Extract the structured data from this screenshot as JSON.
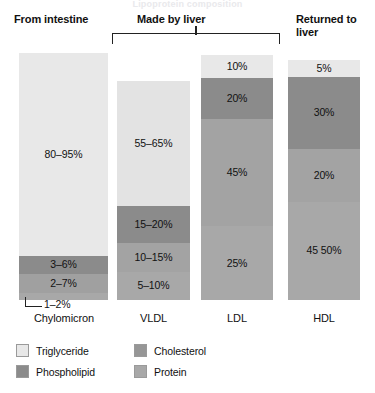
{
  "top_artifact_text": "Lipoprotein composition",
  "headers": {
    "intestine": "From intestine",
    "liver": "Made by liver",
    "returned": "Returned to\nliver"
  },
  "callout": {
    "label": "1–2%"
  },
  "legend": {
    "items": [
      {
        "label": "Triglyceride",
        "color": "#e8e8e8"
      },
      {
        "label": "Cholesterol",
        "color": "#969696"
      },
      {
        "label": "Phospholipid",
        "color": "#8b8b8b"
      },
      {
        "label": "Protein",
        "color": "#a8a8a8"
      }
    ]
  },
  "chart_data": {
    "type": "bar",
    "title": "Lipoprotein composition",
    "subtype": "stacked-bar-100pct",
    "xlabel": "",
    "ylabel": "",
    "ylim": [
      0,
      100
    ],
    "grid": false,
    "legend_position": "bottom-left",
    "categories": [
      "Chylomicron",
      "VLDL",
      "LDL",
      "HDL"
    ],
    "group_headers": [
      {
        "label": "From intestine",
        "categories": [
          "Chylomicron"
        ]
      },
      {
        "label": "Made by liver",
        "categories": [
          "VLDL",
          "LDL"
        ]
      },
      {
        "label": "Returned to liver",
        "categories": [
          "HDL"
        ]
      }
    ],
    "series": [
      {
        "name": "Triglyceride",
        "color": "#e8e8e8",
        "values": [
          87.5,
          60,
          10,
          5
        ]
      },
      {
        "name": "Phospholipid",
        "color": "#8b8b8b",
        "values": [
          4.5,
          17.5,
          20,
          30
        ]
      },
      {
        "name": "Cholesterol",
        "color": "#969696",
        "values": [
          4.5,
          12.5,
          45,
          20
        ]
      },
      {
        "name": "Protein",
        "color": "#a8a8a8",
        "values": [
          1.5,
          7.5,
          25,
          47.5
        ]
      }
    ],
    "bars": [
      {
        "category": "Chylomicron",
        "segments": [
          {
            "component": "Triglyceride",
            "label": "80–95%",
            "low": 80,
            "high": 95,
            "pixel_share": 82.0,
            "color": "#e8e8e8",
            "label_visible": true
          },
          {
            "component": "Phospholipid",
            "label": "3–6%",
            "low": 3,
            "high": 6,
            "pixel_share": 7.5,
            "color": "#8b8b8b",
            "label_visible": true
          },
          {
            "component": "Cholesterol",
            "label": "2–7%",
            "low": 2,
            "high": 7,
            "pixel_share": 7.5,
            "color": "#a0a0a0",
            "label_visible": true
          },
          {
            "component": "Protein",
            "label": "1–2%",
            "low": 1,
            "high": 2,
            "pixel_share": 3.0,
            "color": "#a8a8a8",
            "label_visible": false
          }
        ]
      },
      {
        "category": "VLDL",
        "segments": [
          {
            "component": "Triglyceride",
            "label": "55–65%",
            "low": 55,
            "high": 65,
            "pixel_share": 57.0,
            "color": "#e3e3e3",
            "label_visible": true
          },
          {
            "component": "Phospholipid",
            "label": "15–20%",
            "low": 15,
            "high": 20,
            "pixel_share": 17.0,
            "color": "#8b8b8b",
            "label_visible": true
          },
          {
            "component": "Cholesterol",
            "label": "10–15%",
            "low": 10,
            "high": 15,
            "pixel_share": 13.0,
            "color": "#a3a3a3",
            "label_visible": true
          },
          {
            "component": "Protein",
            "label": "5–10%",
            "low": 5,
            "high": 10,
            "pixel_share": 13.0,
            "color": "#a8a8a8",
            "label_visible": true
          }
        ]
      },
      {
        "category": "LDL",
        "segments": [
          {
            "component": "Triglyceride",
            "label": "10%",
            "value": 10,
            "pixel_share": 9.5,
            "color": "#e8e8e8",
            "label_visible": true
          },
          {
            "component": "Phospholipid",
            "label": "20%",
            "value": 20,
            "pixel_share": 16.5,
            "color": "#8b8b8b",
            "label_visible": true
          },
          {
            "component": "Cholesterol",
            "label": "45%",
            "value": 45,
            "pixel_share": 44.0,
            "color": "#a3a3a3",
            "label_visible": true
          },
          {
            "component": "Protein",
            "label": "25%",
            "value": 25,
            "pixel_share": 30.0,
            "color": "#a8a8a8",
            "label_visible": true
          }
        ]
      },
      {
        "category": "HDL",
        "segments": [
          {
            "component": "Triglyceride",
            "label": "5%",
            "value": 5,
            "pixel_share": 7.0,
            "color": "#e8e8e8",
            "label_visible": true
          },
          {
            "component": "Phospholipid",
            "label": "30%",
            "value": 30,
            "pixel_share": 30.0,
            "color": "#8b8b8b",
            "label_visible": true
          },
          {
            "component": "Cholesterol",
            "label": "20%",
            "value": 20,
            "pixel_share": 22.0,
            "color": "#a3a3a3",
            "label_visible": true
          },
          {
            "component": "Protein",
            "label": "45 50%",
            "low": 45,
            "high": 50,
            "pixel_share": 41.0,
            "color": "#a8a8a8",
            "label_visible": true
          }
        ]
      }
    ]
  }
}
